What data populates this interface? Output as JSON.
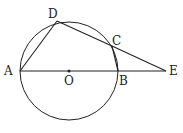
{
  "diagram": {
    "circle": {
      "center": "O",
      "cx": 69,
      "cy": 71,
      "r": 49
    },
    "points": {
      "A": {
        "x": 20,
        "y": 71,
        "label": "A",
        "lx": 4,
        "ly": 75
      },
      "B": {
        "x": 118,
        "y": 71,
        "label": "B",
        "lx": 119,
        "ly": 85
      },
      "C": {
        "x": 112,
        "y": 46,
        "label": "C",
        "lx": 112,
        "ly": 45
      },
      "D": {
        "x": 57,
        "y": 21,
        "label": "D",
        "lx": 48,
        "ly": 18
      },
      "E": {
        "x": 166,
        "y": 71,
        "label": "E",
        "lx": 169,
        "ly": 75
      },
      "O": {
        "x": 69,
        "y": 71,
        "label": "O",
        "lx": 64,
        "ly": 85
      }
    },
    "segments": [
      [
        "A",
        "D"
      ],
      [
        "D",
        "C"
      ],
      [
        "C",
        "E"
      ],
      [
        "C",
        "B"
      ],
      [
        "A",
        "E"
      ]
    ],
    "colors": {
      "stroke": "#222222",
      "background": "#ffffff"
    }
  }
}
